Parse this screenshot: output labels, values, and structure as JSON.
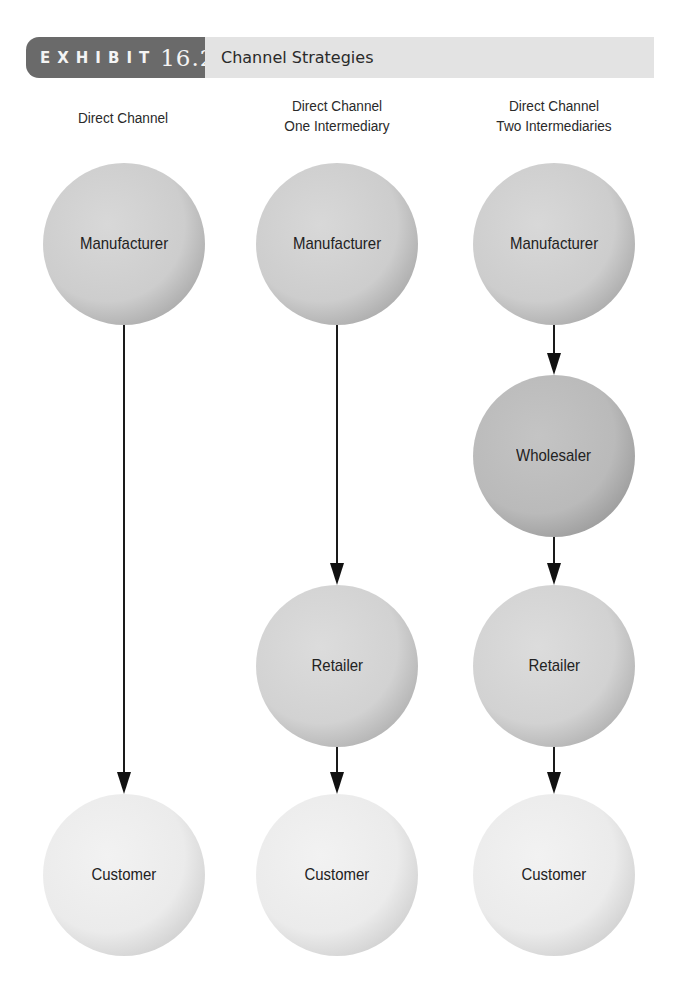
{
  "header": {
    "exhibit_label": "EXHIBIT",
    "exhibit_number": "16.2",
    "title": "Channel Strategies",
    "colors": {
      "dark": "#6a6a6a",
      "light": "#e3e3e3"
    }
  },
  "columns": [
    {
      "title_line1": "Direct Channel",
      "title_line2": "",
      "nodes": [
        "Manufacturer",
        "Customer"
      ]
    },
    {
      "title_line1": "Direct Channel",
      "title_line2": "One Intermediary",
      "nodes": [
        "Manufacturer",
        "Retailer",
        "Customer"
      ]
    },
    {
      "title_line1": "Direct Channel",
      "title_line2": "Two Intermediaries",
      "nodes": [
        "Manufacturer",
        "Wholesaler",
        "Retailer",
        "Customer"
      ]
    }
  ],
  "node_colors": {
    "Manufacturer": "#cdcdcd",
    "Wholesaler": "#bababa",
    "Retailer": "#d2d2d2",
    "Customer": "#ebebeb"
  }
}
